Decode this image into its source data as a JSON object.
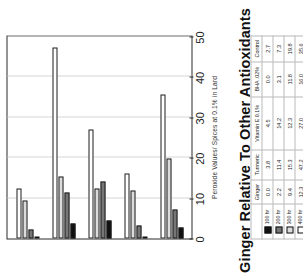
{
  "chart_data": {
    "type": "bar",
    "title": "Ginger Relative To Other Antioxidants",
    "xlabel": "Peroxide Values/ Spices at 0.1% in Lard",
    "ylabel": "",
    "orientation": "horizontal",
    "xlim": [
      0,
      50
    ],
    "ticks": [
      0,
      10,
      20,
      30,
      40,
      50
    ],
    "grid": true,
    "legend_position": "table",
    "categories": [
      "Ginger",
      "Turmeric",
      "Vitamin E 0.1%",
      "BHA .02%",
      "Control"
    ],
    "series": [
      {
        "name": "100 hr",
        "color": "#101010",
        "values": [
          0.0,
          3.8,
          4.5,
          0.0,
          2.7
        ]
      },
      {
        "name": "200 hr",
        "color": "#767676",
        "values": [
          2.2,
          11.4,
          14.2,
          3.1,
          7.3
        ]
      },
      {
        "name": "300 hr",
        "color": "#dcdcdc",
        "values": [
          9.4,
          15.3,
          12.3,
          11.8,
          19.8
        ]
      },
      {
        "name": "400 hr",
        "color": "#ffffff",
        "values": [
          12.3,
          47.2,
          27.0,
          16.0,
          35.6
        ]
      }
    ]
  },
  "table": {
    "corner_label": "",
    "column_headers": [
      "Ginger",
      "Turmeric",
      "Vitamin E 0.1%",
      "BHA .02%",
      "Control"
    ],
    "rows": [
      {
        "label": "100 hr",
        "swatch": "#101010",
        "values": [
          "0.0",
          "3.8",
          "4.5",
          "0.0",
          "2.7"
        ]
      },
      {
        "label": "200 hr",
        "swatch": "#767676",
        "values": [
          "2.2",
          "11.4",
          "14.2",
          "3.1",
          "7.3"
        ]
      },
      {
        "label": "300 hr",
        "swatch": "#dcdcdc",
        "values": [
          "9.4",
          "15.3",
          "12.3",
          "11.8",
          "19.8"
        ]
      },
      {
        "label": "400 hr",
        "swatch": "#ffffff",
        "values": [
          "12.3",
          "47.2",
          "27.0",
          "16.0",
          "35.6"
        ]
      }
    ]
  }
}
